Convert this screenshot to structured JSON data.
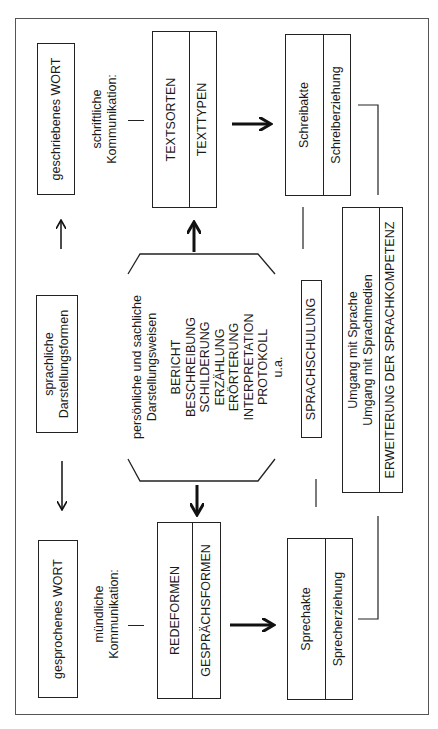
{
  "diagram": {
    "top_row": {
      "written_word": "geschriebenes WORT",
      "written_comm": [
        "schriftliche",
        "Kommunikation:"
      ],
      "text_box": {
        "top": "TEXTSORTEN",
        "bottom": "TEXTTYPEN"
      },
      "write_box": {
        "top": "Schreibakte",
        "bottom": "Schreiberziehung"
      }
    },
    "middle_row": {
      "forms": [
        "sprachliche",
        "Darstellungsformen"
      ],
      "octagon": {
        "heading": [
          "persönliche und sachliche",
          "Darstellungsweisen"
        ],
        "items": [
          "BERICHT",
          "BESCHREIBUNG",
          "SCHILDERUNG",
          "ERZÄHLUNG",
          "ERÖRTERUNG",
          "INTERPRETATION",
          "PROTOKOLL",
          "u.a."
        ]
      },
      "training": "SPRACHSCHULUNG",
      "competence_box": {
        "line1": "Umgang mit Sprache",
        "line2": "Umgang mit Sprachmedien",
        "bottom": "ERWEITERUNG DER SPRACHKOMPETENZ"
      }
    },
    "bottom_row": {
      "spoken_word": "gesprochenes WORT",
      "spoken_comm": [
        "mündliche",
        "Kommunikation:"
      ],
      "speech_box": {
        "top": "REDEFORMEN",
        "bottom": "GESPRÄCHSFORMEN"
      },
      "speak_box": {
        "top": "Sprechakte",
        "bottom": "Sprecherziehung"
      }
    },
    "colors": {
      "line": "#222222",
      "frame": "#555555",
      "background": "#ffffff"
    }
  }
}
